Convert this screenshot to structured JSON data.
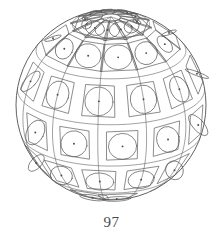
{
  "figure": {
    "caption": "97",
    "kind": "sphere-with-tiled-square-and-circle-pattern",
    "colors": {
      "background": "#ffffff",
      "line": "#5c5c5c",
      "outline": "#4f4f4f",
      "grid": "#6e6e6e",
      "dot": "#4a4a4a",
      "caption": "#4a4a4a"
    },
    "geometry": {
      "center_x": 111,
      "center_y": 105,
      "radius": 95,
      "view_latitude_deg": 22,
      "view_longitude_deg": 8,
      "pole_screen_x": 113,
      "pole_screen_y": 28
    },
    "grid": {
      "latitude_lines_deg": [
        66,
        38,
        10,
        -18,
        -46
      ],
      "longitude_lines_deg": [
        -150,
        -120,
        -90,
        -60,
        -30,
        0,
        30,
        60,
        90,
        120,
        150,
        180
      ],
      "tile_rows": 6,
      "tiles_per_row": 12,
      "tile_row_latitudes_deg": [
        74,
        52,
        24,
        -4,
        -32,
        -60
      ],
      "tile_half_size_deg": 9.5,
      "tile_parts": [
        "outer-quadrilateral",
        "inscribed-circle",
        "center-dot"
      ]
    }
  }
}
